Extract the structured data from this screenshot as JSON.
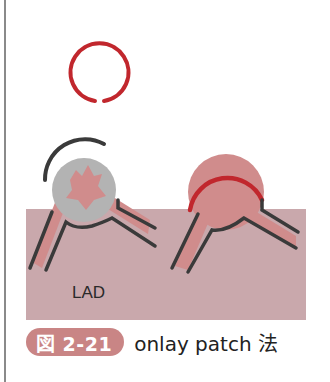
{
  "figure": {
    "label_vessel": "LAD",
    "caption_badge": "図 2-21",
    "caption_text": "onlay patch 法"
  },
  "colors": {
    "tissue": "#c9a8ac",
    "vessel_fill": "#d08c8c",
    "patch_red": "#c1272d",
    "suture_dark": "#3a3a3a",
    "aneurysm_gray": "#b3b3b3",
    "badge": "#c98585"
  }
}
